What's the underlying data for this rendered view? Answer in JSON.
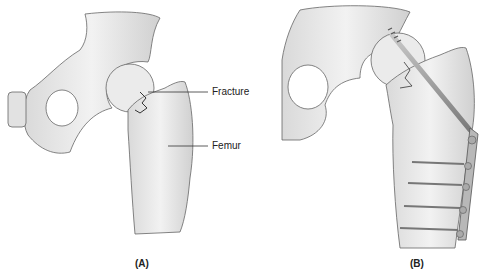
{
  "panels": [
    {
      "id": "A",
      "caption": "(A)",
      "description": "Hip joint with femoral neck fracture",
      "labels": [
        {
          "text": "Fracture",
          "points_to": "femoral-neck-fracture"
        },
        {
          "text": "Femur",
          "points_to": "femur-shaft"
        }
      ]
    },
    {
      "id": "B",
      "caption": "(B)",
      "description": "Fracture fixed with lag screw and side plate with four cortical screws"
    }
  ],
  "colors": {
    "bone_fill": "#ececec",
    "bone_shade": "#d6d6d6",
    "outline": "#555555",
    "hardware": "#9a9a9a",
    "text": "#222222"
  }
}
